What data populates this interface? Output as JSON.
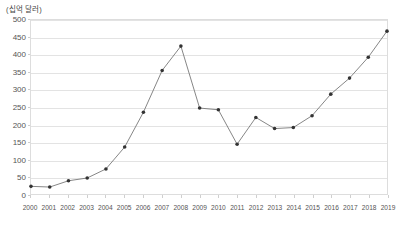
{
  "chart": {
    "unit_label": "(십억 달러)",
    "line_color": "#777777",
    "marker_color": "#333333",
    "grid_color": "#e3e3e3",
    "axis_color": "#dddddd",
    "text_color": "#555555"
  },
  "chart_data": {
    "type": "line",
    "title": "",
    "subtitle": "",
    "xlabel": "",
    "ylabel": "(십억 달러)",
    "grid": true,
    "legend": "none",
    "ylim": [
      0,
      500
    ],
    "ytick_step": 50,
    "yticks": [
      0,
      50,
      100,
      150,
      200,
      250,
      300,
      350,
      400,
      450,
      500
    ],
    "categories": [
      "2000",
      "2001",
      "2002",
      "2003",
      "2004",
      "2005",
      "2006",
      "2007",
      "2008",
      "2009",
      "2010",
      "2011",
      "2012",
      "2013",
      "2014",
      "2015",
      "2016",
      "2017",
      "2018",
      "2019"
    ],
    "values": [
      22,
      20,
      38,
      46,
      72,
      135,
      235,
      355,
      425,
      247,
      242,
      143,
      220,
      188,
      191,
      225,
      287,
      333,
      393,
      468
    ],
    "series": [
      {
        "name": "value",
        "values": [
          22,
          20,
          38,
          46,
          72,
          135,
          235,
          355,
          425,
          247,
          242,
          143,
          220,
          188,
          191,
          225,
          287,
          333,
          393,
          468
        ]
      }
    ]
  }
}
